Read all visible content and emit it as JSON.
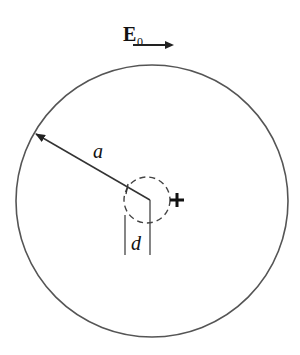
{
  "diagram": {
    "field_label": "E",
    "field_subscript": "0",
    "radius_label": "a",
    "offset_label": "d",
    "charge_symbol": "+",
    "outer_circle": {
      "cx": 152,
      "cy": 201,
      "r": 136
    },
    "inner_circle": {
      "cx": 147,
      "cy": 200,
      "r": 23,
      "style": "dashed"
    },
    "line_color": "#333333"
  }
}
